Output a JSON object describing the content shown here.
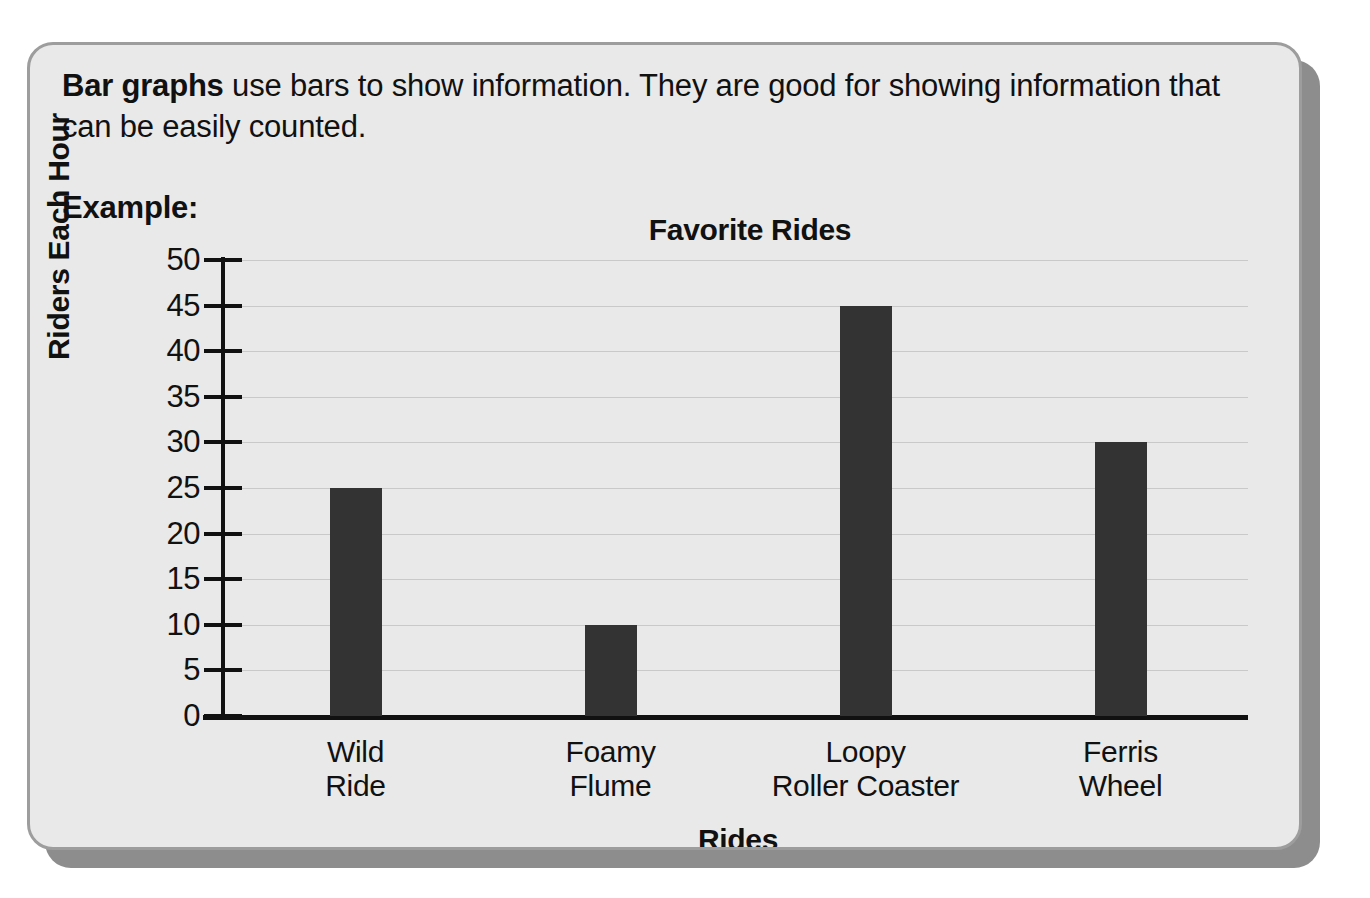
{
  "worksheet": {
    "intro_bold": "Bar graphs",
    "intro_rest": " use bars to show information. They are good for showing information that can be easily counted.",
    "example_label": "Example:"
  },
  "chart_data": {
    "type": "bar",
    "title": "Favorite Rides",
    "xlabel": "Rides",
    "ylabel": "Riders Each Hour",
    "categories": [
      "Wild Ride",
      "Foamy Flume",
      "Loopy Roller Coaster",
      "Ferris Wheel"
    ],
    "category_lines": [
      [
        "Wild",
        "Ride"
      ],
      [
        "Foamy",
        "Flume"
      ],
      [
        "Loopy",
        "Roller Coaster"
      ],
      [
        "Ferris",
        "Wheel"
      ]
    ],
    "values": [
      25,
      10,
      45,
      30
    ],
    "ylim": [
      0,
      50
    ],
    "ytick_step": 5,
    "yticks": [
      0,
      5,
      10,
      15,
      20,
      25,
      30,
      35,
      40,
      45,
      50
    ],
    "ytick_labels": [
      "0",
      "5",
      "10",
      "15",
      "20",
      "25",
      "30",
      "35",
      "40",
      "45",
      "50"
    ],
    "grid": true,
    "legend": false,
    "bar_color": "#333333",
    "grid_color": "#c9c9c9",
    "axis_color": "#111111"
  },
  "style": {
    "card_background": "#e9e9e9",
    "card_border": "#9d9d9d",
    "shadow_color": "#8d8d8d",
    "page_background": "#ffffff",
    "text_color": "#111111"
  }
}
